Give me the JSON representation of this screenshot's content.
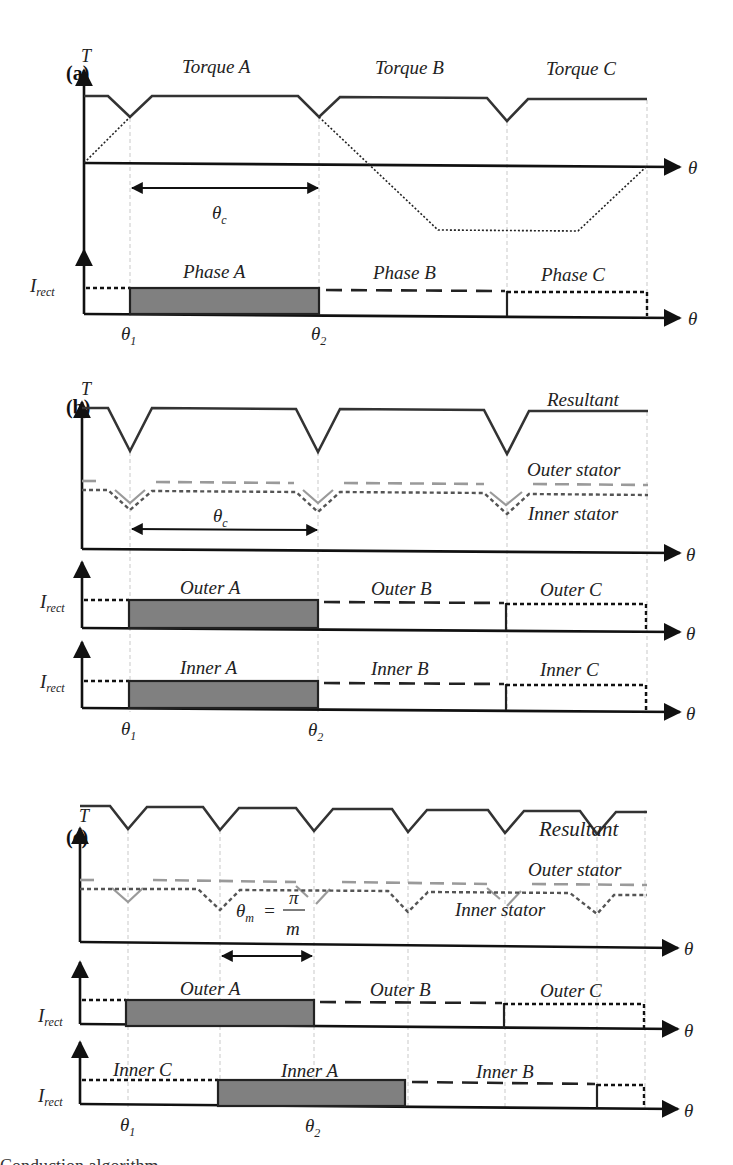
{
  "figure": {
    "panels": [
      {
        "id": "a",
        "label": "(a)",
        "torque_axis": "T",
        "theta_axis": "θ",
        "torque_labels": [
          "Torque A",
          "Torque B",
          "Torque C"
        ],
        "commutation_angle": {
          "symbol": "θ",
          "subscript": "c"
        },
        "current_axis": {
          "symbol": "I",
          "subscript": "rect"
        },
        "current_labels": [
          "Phase A",
          "Phase B",
          "Phase C"
        ],
        "angle_marks": [
          {
            "symbol": "θ",
            "subscript": "1"
          },
          {
            "symbol": "θ",
            "subscript": "2"
          }
        ]
      },
      {
        "id": "b",
        "label": "(b)",
        "torque_axis": "T",
        "theta_axis": "θ",
        "curve_labels": {
          "resultant": "Resultant",
          "outer": "Outer stator",
          "inner": "Inner stator"
        },
        "commutation_angle": {
          "symbol": "θ",
          "subscript": "c"
        },
        "current_axis": {
          "symbol": "I",
          "subscript": "rect"
        },
        "outer_current_labels": [
          "Outer A",
          "Outer B",
          "Outer C"
        ],
        "inner_current_labels": [
          "Inner A",
          "Inner B",
          "Inner C"
        ],
        "angle_marks": [
          {
            "symbol": "θ",
            "subscript": "1"
          },
          {
            "symbol": "θ",
            "subscript": "2"
          }
        ]
      },
      {
        "id": "c",
        "label": "(c)",
        "torque_axis": "T",
        "theta_axis": "θ",
        "curve_labels": {
          "resultant": "Resultant",
          "outer": "Outer stator",
          "inner": "Inner stator"
        },
        "shift_angle": {
          "lhs": "θ",
          "lhs_sub": "m",
          "eq": "=",
          "num": "π",
          "den": "m"
        },
        "current_axis": {
          "symbol": "I",
          "subscript": "rect"
        },
        "outer_current_labels": [
          "Outer A",
          "Outer B",
          "Outer C"
        ],
        "inner_current_labels": [
          "Inner C",
          "Inner A",
          "Inner B"
        ],
        "angle_marks": [
          {
            "symbol": "θ",
            "subscript": "1"
          },
          {
            "symbol": "θ",
            "subscript": "2"
          }
        ]
      }
    ],
    "caption_fragment": "Conduction algorithm..."
  },
  "colors": {
    "resultant": "#333333",
    "outer_stator": "#9a9a9a",
    "inner_stator": "#555555",
    "conduction_fill": "#808080"
  }
}
